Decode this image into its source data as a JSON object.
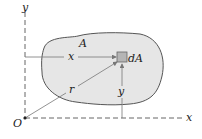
{
  "diagram": {
    "area_label": "A",
    "element_label": "dA",
    "x_distance_label": "x",
    "y_distance_label": "y",
    "r_label": "r",
    "origin_label": "O",
    "x_axis_label": "x",
    "y_axis_label": "y",
    "colors": {
      "region_fill": "#e6e6e6",
      "region_stroke": "#555555",
      "element_fill": "#b5b5b5",
      "axis": "#666666",
      "arrow": "#777777"
    }
  }
}
